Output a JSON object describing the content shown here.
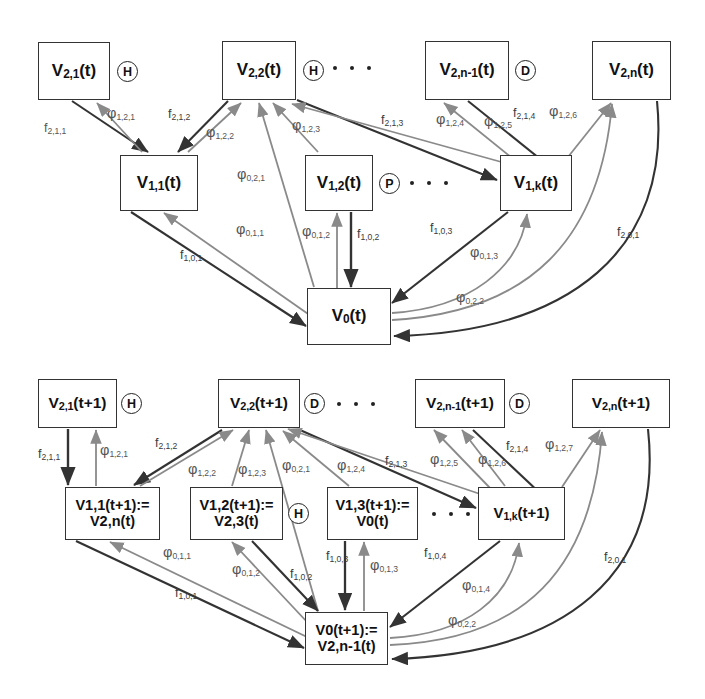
{
  "figure": {
    "type": "node-link-diagram",
    "panels": [
      "top",
      "bottom"
    ]
  },
  "top_panel": {
    "name": "state-at-t",
    "nodes": [
      {
        "id": "t_v21",
        "label": "V2,1(t)",
        "base": "V",
        "sub": "2,1",
        "arg": "(t)",
        "tag": "H",
        "x": 38,
        "y": 42,
        "w": 72,
        "h": 58
      },
      {
        "id": "t_v22",
        "label": "V2,2(t)",
        "base": "V",
        "sub": "2,2",
        "arg": "(t)",
        "tag": "H",
        "x": 222,
        "y": 41,
        "w": 74,
        "h": 59
      },
      {
        "id": "t_v2n1",
        "label": "V2,n-1(t)",
        "base": "V",
        "sub": "2,n-1",
        "arg": "(t)",
        "tag": "D",
        "x": 425,
        "y": 41,
        "w": 84,
        "h": 59
      },
      {
        "id": "t_v2n",
        "label": "V2,n(t)",
        "base": "V",
        "sub": "2,n",
        "arg": "(t)",
        "tag": "",
        "x": 592,
        "y": 41,
        "w": 79,
        "h": 59
      },
      {
        "id": "t_v11",
        "label": "V1,1(t)",
        "base": "V",
        "sub": "1,1",
        "arg": "(t)",
        "tag": "",
        "x": 120,
        "y": 155,
        "w": 78,
        "h": 56
      },
      {
        "id": "t_v12",
        "label": "V1,2(t)",
        "base": "V",
        "sub": "1,2",
        "arg": "(t)",
        "tag": "P",
        "x": 305,
        "y": 155,
        "w": 68,
        "h": 56
      },
      {
        "id": "t_v1k",
        "label": "V1,k(t)",
        "base": "V",
        "sub": "1,k",
        "arg": "(t)",
        "tag": "",
        "x": 500,
        "y": 155,
        "w": 72,
        "h": 56
      },
      {
        "id": "t_v0",
        "label": "V0(t)",
        "base": "V",
        "sub": "0",
        "arg": "(t)",
        "tag": "",
        "x": 307,
        "y": 288,
        "w": 84,
        "h": 57
      }
    ],
    "ellipses": [
      {
        "after": "t_v22",
        "x": 322,
        "y": 67,
        "dots": 3
      },
      {
        "after": "t_v12",
        "x": 398,
        "y": 182,
        "dots": 3
      }
    ],
    "edge_labels": [
      {
        "id": "f211",
        "kind": "f",
        "sub": "2,1,1",
        "x": 44,
        "y": 122
      },
      {
        "id": "p1211",
        "kind": "phi",
        "sub": "1,2,1",
        "x": 107,
        "y": 106
      },
      {
        "id": "f212",
        "kind": "f",
        "sub": "2,1,2",
        "x": 168,
        "y": 108
      },
      {
        "id": "p1222",
        "kind": "phi",
        "sub": "1,2,2",
        "x": 206,
        "y": 125
      },
      {
        "id": "p1223",
        "kind": "phi",
        "sub": "1,2,3",
        "x": 292,
        "y": 118
      },
      {
        "id": "f213",
        "kind": "f",
        "sub": "2,1,3",
        "x": 381,
        "y": 114
      },
      {
        "id": "p1224",
        "kind": "phi",
        "sub": "1,2,4",
        "x": 436,
        "y": 112
      },
      {
        "id": "p1225",
        "kind": "phi",
        "sub": "1,2,5",
        "x": 484,
        "y": 114
      },
      {
        "id": "f214",
        "kind": "f",
        "sub": "2,1,4",
        "x": 513,
        "y": 107
      },
      {
        "id": "p1226",
        "kind": "phi",
        "sub": "1,2,6",
        "x": 549,
        "y": 104
      },
      {
        "id": "p0211",
        "kind": "phi",
        "sub": "0,2,1",
        "x": 237,
        "y": 167
      },
      {
        "id": "p0111",
        "kind": "phi",
        "sub": "0,1,1",
        "x": 236,
        "y": 222
      },
      {
        "id": "p0112",
        "kind": "phi",
        "sub": "0,1,2",
        "x": 302,
        "y": 224
      },
      {
        "id": "f102",
        "kind": "f",
        "sub": "1,0,2",
        "x": 353,
        "y": 230
      },
      {
        "id": "f101",
        "kind": "f",
        "sub": "1,0,1",
        "x": 180,
        "y": 249
      },
      {
        "id": "f103",
        "kind": "f",
        "sub": "1,0,3",
        "x": 430,
        "y": 222
      },
      {
        "id": "p0113",
        "kind": "phi",
        "sub": "0,1,3",
        "x": 470,
        "y": 245
      },
      {
        "id": "p0222",
        "kind": "phi",
        "sub": "0,2,2",
        "x": 456,
        "y": 290
      },
      {
        "id": "f201",
        "kind": "f",
        "sub": "2,0,1",
        "x": 617,
        "y": 226
      }
    ]
  },
  "bottom_panel": {
    "name": "state-at-t-plus-1",
    "nodes": [
      {
        "id": "b_v21",
        "label": "V2,1(t+1)",
        "base": "V",
        "sub": "2,1",
        "arg": "(t+1)",
        "tag": "H",
        "x": 38,
        "y": 379,
        "w": 79,
        "h": 49
      },
      {
        "id": "b_v22",
        "label": "V2,2(t+1)",
        "base": "V",
        "sub": "2,2",
        "arg": "(t+1)",
        "tag": "D",
        "x": 218,
        "y": 379,
        "w": 82,
        "h": 49
      },
      {
        "id": "b_v2n1",
        "label": "V2,n-1(t+1)",
        "base": "V",
        "sub": "2,n-1",
        "arg": "(t+1)",
        "tag": "D",
        "x": 415,
        "y": 379,
        "w": 90,
        "h": 49
      },
      {
        "id": "b_v2n",
        "label": "V2,n(t+1)",
        "base": "V",
        "sub": "2,n",
        "arg": "(t+1)",
        "tag": "",
        "x": 572,
        "y": 379,
        "w": 98,
        "h": 49
      },
      {
        "id": "b_v11",
        "line1": "V1,1(t+1):=",
        "line2": "V2,n(t)",
        "tag": "",
        "x": 65,
        "y": 487,
        "w": 95,
        "h": 53
      },
      {
        "id": "b_v12",
        "line1": "V1,2(t+1):=",
        "line2": "V2,3(t)",
        "tag": "H",
        "x": 190,
        "y": 487,
        "w": 93,
        "h": 53
      },
      {
        "id": "b_v13",
        "line1": "V1,3(t+1):=",
        "line2": "V0(t)",
        "tag": "",
        "x": 327,
        "y": 487,
        "w": 91,
        "h": 53
      },
      {
        "id": "b_v1k",
        "label": "V1,k(t+1)",
        "base": "V",
        "sub": "1,k",
        "arg": "(t+1)",
        "tag": "",
        "x": 478,
        "y": 487,
        "w": 87,
        "h": 53
      },
      {
        "id": "b_v0",
        "line1": "V0(t+1):=",
        "line2": "V2,n-1(t)",
        "tag": "",
        "x": 305,
        "y": 612,
        "w": 83,
        "h": 53
      }
    ],
    "ellipses": [
      {
        "after": "b_v22",
        "x": 330,
        "y": 403,
        "dots": 3
      },
      {
        "after": "b_v13",
        "x": 430,
        "y": 513,
        "dots": 3
      }
    ],
    "edge_labels": [
      {
        "id": "bf211",
        "kind": "f",
        "sub": "2,1,1",
        "x": 44,
        "y": 448
      },
      {
        "id": "bp1211",
        "kind": "phi",
        "sub": "1,2,1",
        "x": 100,
        "y": 443
      },
      {
        "id": "bf212",
        "kind": "f",
        "sub": "2,1,2",
        "x": 155,
        "y": 437
      },
      {
        "id": "bp1222",
        "kind": "phi",
        "sub": "1,2,2",
        "x": 188,
        "y": 462
      },
      {
        "id": "bp1223",
        "kind": "phi",
        "sub": "1,2,3",
        "x": 238,
        "y": 462
      },
      {
        "id": "bp0211",
        "kind": "phi",
        "sub": "0,2,1",
        "x": 282,
        "y": 458
      },
      {
        "id": "bp1224",
        "kind": "phi",
        "sub": "1,2,4",
        "x": 337,
        "y": 458
      },
      {
        "id": "bf213",
        "kind": "f",
        "sub": "2,1,3",
        "x": 385,
        "y": 455
      },
      {
        "id": "bp1225",
        "kind": "phi",
        "sub": "1,2,5",
        "x": 430,
        "y": 452
      },
      {
        "id": "bp1226",
        "kind": "phi",
        "sub": "1,2,6",
        "x": 478,
        "y": 452
      },
      {
        "id": "bf214",
        "kind": "f",
        "sub": "2,1,4",
        "x": 506,
        "y": 440
      },
      {
        "id": "bp1227",
        "kind": "phi",
        "sub": "1,2,7",
        "x": 545,
        "y": 437
      },
      {
        "id": "bp0111",
        "kind": "phi",
        "sub": "0,1,1",
        "x": 163,
        "y": 545
      },
      {
        "id": "bp0112",
        "kind": "phi",
        "sub": "0,1,2",
        "x": 232,
        "y": 562
      },
      {
        "id": "bf102",
        "kind": "f",
        "sub": "1,0,2",
        "x": 290,
        "y": 568
      },
      {
        "id": "bf103",
        "kind": "f",
        "sub": "1,0,3",
        "x": 326,
        "y": 550
      },
      {
        "id": "bp0113",
        "kind": "phi",
        "sub": "0,1,3",
        "x": 370,
        "y": 558
      },
      {
        "id": "bf101",
        "kind": "f",
        "sub": "1,0,1",
        "x": 175,
        "y": 587
      },
      {
        "id": "bf104",
        "kind": "f",
        "sub": "1,0,4",
        "x": 424,
        "y": 547
      },
      {
        "id": "bp0114",
        "kind": "phi",
        "sub": "0,1,4",
        "x": 462,
        "y": 578
      },
      {
        "id": "bp0222",
        "kind": "phi",
        "sub": "0,2,2",
        "x": 448,
        "y": 613
      },
      {
        "id": "bf201",
        "kind": "f",
        "sub": "2,0,1",
        "x": 604,
        "y": 551
      }
    ]
  },
  "tags": {
    "H": "H",
    "D": "D",
    "P": "P"
  },
  "colors": {
    "stroke": "#333333",
    "light_stroke": "#808080",
    "text": "#111111",
    "label": "#555555",
    "background": "#ffffff"
  }
}
